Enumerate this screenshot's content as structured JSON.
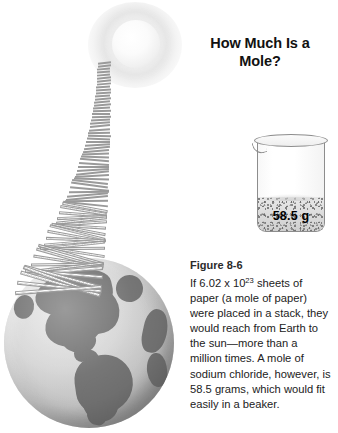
{
  "figure": {
    "title": "How Much Is a\nMole?",
    "label": "Figure 8-6",
    "caption": "If 6.02 x 1023 sheets of paper (a mole of paper) were placed in a stack, they would reach from Earth to the sun—more than a million times. A mole of sodium chloride, however, is 58.5 grams, which would fit easily in a beaker."
  },
  "illustration": {
    "sun": {
      "name": "sun-illustration",
      "alt": "Sun"
    },
    "paper_stack": {
      "name": "paper-stack-illustration",
      "alt": "Stack of paper sheets reaching from Earth to the sun"
    },
    "earth": {
      "name": "earth-globe-illustration",
      "alt": "Earth globe showing North and South America"
    },
    "beaker": {
      "name": "beaker-illustration",
      "alt": "Beaker containing sodium chloride",
      "mass_label": "58.5 g"
    }
  },
  "colors": {
    "background": "#ffffff",
    "text": "#222222",
    "label_text": "#2b2b2b",
    "globe_land": "#6f6f6f",
    "globe_ocean": "#c7c7c7",
    "glass_outline": "#8d8d8d"
  }
}
